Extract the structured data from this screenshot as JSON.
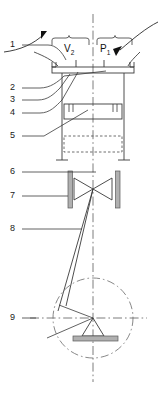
{
  "figure": {
    "type": "technical-line-drawing",
    "title": "",
    "background_color": "#ffffff",
    "line_color": "#3a3a3a",
    "centerline_color": "#555555",
    "hatch_fill_color": "#b3b3b3",
    "width_px": 158,
    "height_px": 393
  },
  "callouts": [
    {
      "id": "1",
      "label": "1",
      "x": 12,
      "y": 45,
      "leader_to_x": 78,
      "leader_to_y": 68
    },
    {
      "id": "2",
      "label": "2",
      "x": 12,
      "y": 88,
      "leader_to_x": 90,
      "leader_to_y": 72
    },
    {
      "id": "3",
      "label": "3",
      "x": 12,
      "y": 100,
      "leader_to_x": 68,
      "leader_to_y": 72
    },
    {
      "id": "4",
      "label": "4",
      "x": 12,
      "y": 113,
      "leader_to_x": 72,
      "leader_to_y": 119
    },
    {
      "id": "5",
      "label": "5",
      "x": 12,
      "y": 136,
      "leader_to_x": 88,
      "leader_to_y": 111
    },
    {
      "id": "6",
      "label": "6",
      "x": 12,
      "y": 172,
      "leader_to_x": 93,
      "leader_to_y": 172
    },
    {
      "id": "7",
      "label": "7",
      "x": 12,
      "y": 196,
      "leader_to_x": 70,
      "leader_to_y": 196
    },
    {
      "id": "8",
      "label": "8",
      "x": 12,
      "y": 229,
      "leader_to_x": 83,
      "leader_to_y": 229
    },
    {
      "id": "9",
      "label": "9",
      "x": 12,
      "y": 318,
      "leader_to_x": 145,
      "leader_to_y": 318
    }
  ],
  "annotations": [
    {
      "id": "v2",
      "label": "V",
      "subscript": "2",
      "x": 59,
      "y": 45
    },
    {
      "id": "p1",
      "label": "P",
      "subscript": "1",
      "x": 97,
      "y": 45
    }
  ],
  "braces": [
    {
      "id": "brace-v2",
      "from_x": 52,
      "to_x": 90,
      "y": 40
    },
    {
      "id": "brace-p1",
      "from_x": 90,
      "to_x": 132,
      "y": 40
    }
  ],
  "arrows": [
    {
      "id": "arrow-left",
      "tip_x": 41,
      "tip_y": 34,
      "from_x": 6,
      "from_y": 52
    },
    {
      "id": "arrow-right",
      "tip_x": 113,
      "tip_y": 52,
      "from_x": 158,
      "from_y": 24
    }
  ],
  "components": {
    "centerline_x": 93,
    "top_flange": {
      "x": 56,
      "y": 66,
      "width": 74,
      "height": 7
    },
    "chamber": {
      "x": 60,
      "y": 73,
      "width": 66,
      "height": 85
    },
    "inner_block": {
      "x": 64,
      "y": 104,
      "width": 58,
      "height": 15
    },
    "dashed_box": {
      "x": 62,
      "y": 136,
      "width": 62,
      "height": 16
    },
    "valve_seat_left": {
      "x": 68,
      "y": 171,
      "width": 4,
      "height": 37
    },
    "valve_seat_right": {
      "x": 116,
      "y": 171,
      "width": 4,
      "height": 37
    },
    "butterfly_valve": {
      "center_x": 93,
      "center_y": 189,
      "half_width": 21,
      "half_height": 11
    },
    "linkage_rod": {
      "from_x": 93,
      "from_y": 189,
      "to_x": 58,
      "to_y": 310
    },
    "pivot_circle": {
      "center_x": 93,
      "center_y": 318,
      "radius": 40
    },
    "pivot_triangle": {
      "apex_x": 93,
      "apex_y": 318,
      "base_half": 11,
      "base_y": 336
    },
    "ground_bar": {
      "x": 75,
      "y": 336,
      "width": 42,
      "height": 5
    }
  }
}
